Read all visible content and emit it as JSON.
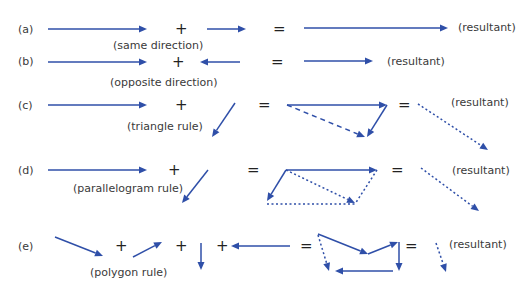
{
  "colors": {
    "vector": "#2f4fa8",
    "text": "#3a3a3a",
    "background": "#ffffff"
  },
  "operators": {
    "plus": "+",
    "equals": "="
  },
  "rows": [
    {
      "id": "a",
      "marker": "(a)",
      "rule": "(same direction)",
      "result_label": "(resultant)"
    },
    {
      "id": "b",
      "marker": "(b)",
      "rule": "(opposite direction)",
      "result_label": "(resultant)"
    },
    {
      "id": "c",
      "marker": "(c)",
      "rule": "(triangle rule)",
      "result_label": "(resultant)"
    },
    {
      "id": "d",
      "marker": "(d)",
      "rule": "(parallelogram rule)",
      "result_label": "(resultant)"
    },
    {
      "id": "e",
      "marker": "(e)",
      "rule": "(polygon rule)",
      "result_label": "(resultant)"
    }
  ]
}
